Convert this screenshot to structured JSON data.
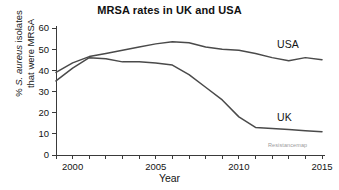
{
  "chart_data": {
    "type": "line",
    "title": "MRSA rates in UK and USA",
    "xlabel": "Year",
    "ylabel_line1": "% S. aureus isolates",
    "ylabel_line2": "that were MRSA",
    "ylabel_italic_part": "S. aureus",
    "xlim": [
      1999,
      2015
    ],
    "ylim": [
      0,
      60
    ],
    "ytick_values": [
      0,
      10,
      20,
      30,
      40,
      50,
      60
    ],
    "ytick_labels": [
      "0",
      "10",
      "20",
      "30",
      "40",
      "50",
      "60"
    ],
    "xtick_values": [
      2000,
      2005,
      2010,
      2015
    ],
    "xtick_labels": [
      "2000",
      "2005",
      "2010",
      "2015"
    ],
    "xminor_values": [
      1999,
      2000,
      2001,
      2002,
      2003,
      2004,
      2005,
      2006,
      2007,
      2008,
      2009,
      2010,
      2011,
      2012,
      2013,
      2014,
      2015
    ],
    "grid": false,
    "legend_position": "inline-right",
    "watermark": "Resistancemap",
    "line_color": "#4a4a4a",
    "axis_color": "#3a3a3a",
    "series": [
      {
        "name": "USA",
        "label": "USA",
        "label_x": 2012.3,
        "label_y": 50.5,
        "x": [
          1999,
          2000,
          2001,
          2002,
          2003,
          2004,
          2005,
          2006,
          2007,
          2008,
          2009,
          2010,
          2011,
          2012,
          2013,
          2014,
          2015
        ],
        "values": [
          39.0,
          43.5,
          46.5,
          48.0,
          49.5,
          51.0,
          52.5,
          53.5,
          53.0,
          51.0,
          50.0,
          49.5,
          48.0,
          46.0,
          44.5,
          46.0,
          45.0
        ]
      },
      {
        "name": "UK",
        "label": "UK",
        "label_x": 2012.3,
        "label_y": 16.0,
        "x": [
          1999,
          2000,
          2001,
          2002,
          2003,
          2004,
          2005,
          2006,
          2007,
          2008,
          2009,
          2010,
          2011,
          2012,
          2013,
          2014,
          2015
        ],
        "values": [
          35.0,
          41.0,
          46.0,
          45.5,
          44.0,
          44.0,
          43.5,
          42.5,
          38.0,
          32.0,
          26.0,
          18.0,
          13.0,
          12.5,
          12.0,
          11.5,
          11.0
        ]
      }
    ]
  }
}
